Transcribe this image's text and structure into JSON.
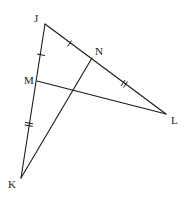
{
  "diagram": {
    "type": "triangle-with-cevians",
    "points": {
      "J": {
        "label": "J",
        "x": 45,
        "y": 24
      },
      "K": {
        "label": "K",
        "x": 21,
        "y": 178
      },
      "L": {
        "label": "L",
        "x": 166,
        "y": 114
      },
      "M": {
        "label": "M",
        "x": 37,
        "y": 81
      },
      "N": {
        "label": "N",
        "x": 92,
        "y": 58
      }
    },
    "segments": [
      "JK",
      "JL",
      "KN",
      "ML"
    ],
    "markings": [
      {
        "segment": "JM",
        "ticks": 1
      },
      {
        "segment": "JN",
        "ticks": 1
      },
      {
        "segment": "MK",
        "ticks": 2
      },
      {
        "segment": "NL",
        "ticks": 2
      }
    ],
    "colors": {
      "stroke": "#1a1a1a",
      "background": "#ffffff"
    }
  }
}
